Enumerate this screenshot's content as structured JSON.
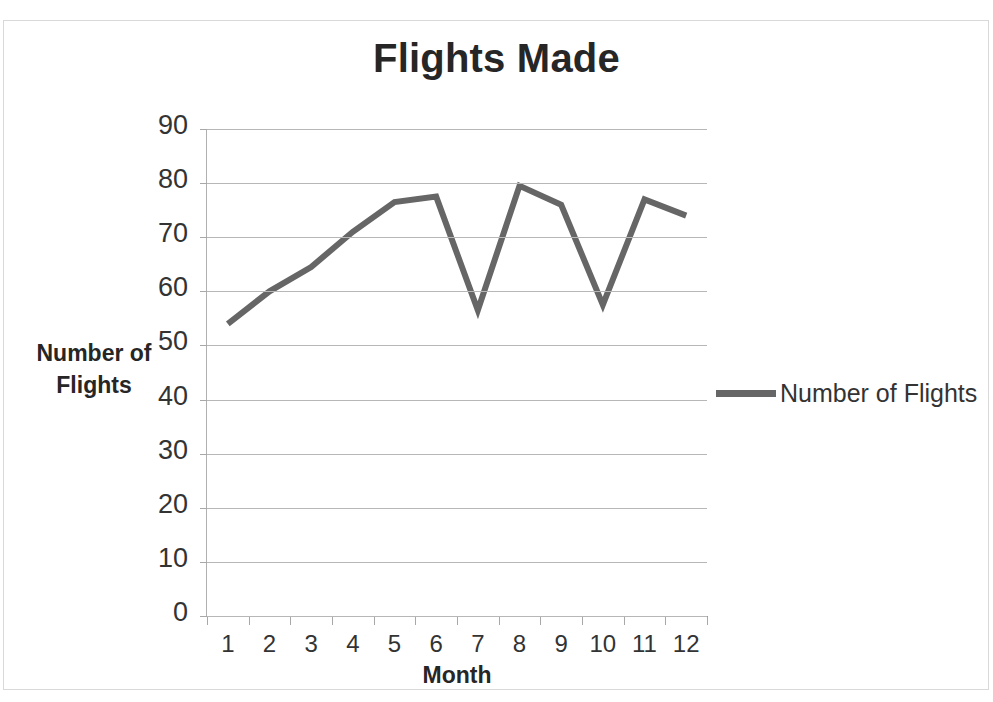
{
  "chart_data": {
    "type": "line",
    "title": "Flights Made",
    "xlabel": "Month",
    "ylabel": "Number of Flights",
    "categories": [
      "1",
      "2",
      "3",
      "4",
      "5",
      "6",
      "7",
      "8",
      "9",
      "10",
      "11",
      "12"
    ],
    "series": [
      {
        "name": "Number of Flights",
        "values": [
          54,
          60,
          64.5,
          71,
          76.5,
          77.5,
          56.5,
          79.5,
          76,
          57.5,
          77,
          74
        ],
        "color": "#666666"
      }
    ],
    "ylim": [
      0,
      90
    ],
    "y_ticks": [
      0,
      10,
      20,
      30,
      40,
      50,
      60,
      70,
      80,
      90
    ],
    "y_tick_labels": [
      "0",
      "10",
      "20",
      "30",
      "40",
      "50",
      "60",
      "70",
      "80",
      "90"
    ],
    "grid": true,
    "grid_axis": "y",
    "grid_color": "#b7b7b7",
    "legend_position": "right",
    "legend_entries": [
      "Number of Flights"
    ],
    "background_color": "#ffffff",
    "border_color": "#d9d9d9"
  }
}
